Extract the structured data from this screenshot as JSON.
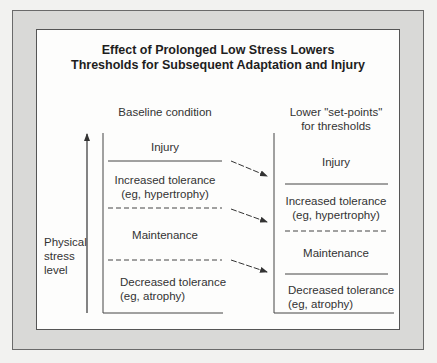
{
  "title": {
    "line1": "Effect of Prolonged Low Stress Lowers",
    "line2": "Thresholds for Subsequent Adaptation and Injury"
  },
  "axis": {
    "label_line1": "Physical",
    "label_line2": "stress",
    "label_line3": "level"
  },
  "baseline": {
    "heading": "Baseline condition",
    "zones": [
      {
        "line1": "Injury",
        "line2": ""
      },
      {
        "line1": "Increased tolerance",
        "line2": "(eg, hypertrophy)"
      },
      {
        "line1": "Maintenance",
        "line2": ""
      },
      {
        "line1": "Decreased tolerance",
        "line2": "(eg, atrophy)"
      }
    ]
  },
  "lowered": {
    "heading_line1": "Lower \"set-points\"",
    "heading_line2": "for thresholds",
    "zones": [
      {
        "line1": "Injury",
        "line2": ""
      },
      {
        "line1": "Increased tolerance",
        "line2": "(eg, hypertrophy)"
      },
      {
        "line1": "Maintenance",
        "line2": ""
      },
      {
        "line1": "Decreased tolerance",
        "line2": "(eg, atrophy)"
      }
    ]
  },
  "colors": {
    "frame": "#d9d9d7",
    "ink": "#333333"
  }
}
